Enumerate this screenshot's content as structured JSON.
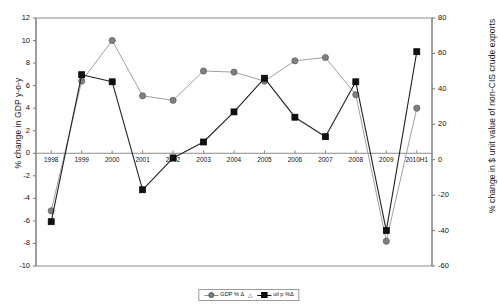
{
  "chart_data": {
    "type": "line",
    "title": "",
    "xlabel": "",
    "categories": [
      "1998",
      "1999",
      "2000",
      "2001",
      "2002",
      "2003",
      "2004",
      "2005",
      "2006",
      "2007",
      "2008",
      "2009",
      "2010H1"
    ],
    "grid": false,
    "legend_position": "bottom",
    "axes": {
      "left": {
        "label": "% change in GDP y-o-y",
        "ylim": [
          -10,
          12
        ],
        "step": 2,
        "ticks": [
          "12",
          "10",
          "8",
          "6",
          "4",
          "2",
          "0",
          "-2",
          "-4",
          "-6",
          "-8",
          "-10"
        ],
        "tick_values": [
          12,
          10,
          8,
          6,
          4,
          2,
          0,
          -2,
          -4,
          -6,
          -8,
          -10
        ]
      },
      "right": {
        "label": "% change in $ unit value of non-CIS crude exports",
        "ylim": [
          -60,
          80
        ],
        "step": 20,
        "ticks": [
          "80",
          "60",
          "40",
          "20",
          "0",
          "-20",
          "-40",
          "-60"
        ],
        "tick_values": [
          80,
          60,
          40,
          20,
          0,
          -20,
          -40,
          -60
        ]
      }
    },
    "series": [
      {
        "name": "GDP %  Δ",
        "axis": "left",
        "marker": "circle",
        "color": "#7f7f7f",
        "line_color": "#a0a0a0",
        "values": [
          -5.1,
          6.4,
          10.0,
          5.1,
          4.7,
          7.3,
          7.2,
          6.4,
          8.2,
          8.5,
          5.2,
          -7.8,
          4.0
        ]
      },
      {
        "name": "oil p %Δ",
        "axis": "right",
        "marker": "square",
        "color": "#111111",
        "line_color": "#222222",
        "values": [
          -35,
          48,
          44,
          -17,
          1,
          10,
          27,
          46,
          24,
          13,
          44,
          -40,
          61
        ]
      }
    ]
  },
  "legend": {
    "separator": "△",
    "items": [
      {
        "label": "GDP %  Δ",
        "marker": "circle-marker",
        "color": "#7f7f7f"
      },
      {
        "label": "oil p %Δ",
        "marker": "square-marker",
        "color": "#111111"
      }
    ]
  }
}
